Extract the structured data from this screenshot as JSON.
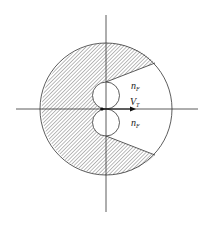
{
  "diagram": {
    "labels": {
      "n_upper": "n",
      "n_upper_sub": "F",
      "v": "V",
      "v_sub": "T",
      "n_lower": "n",
      "n_lower_sub": "F"
    },
    "colors": {
      "line": "#333333",
      "hatch": "#555555",
      "background": "#ffffff"
    }
  }
}
